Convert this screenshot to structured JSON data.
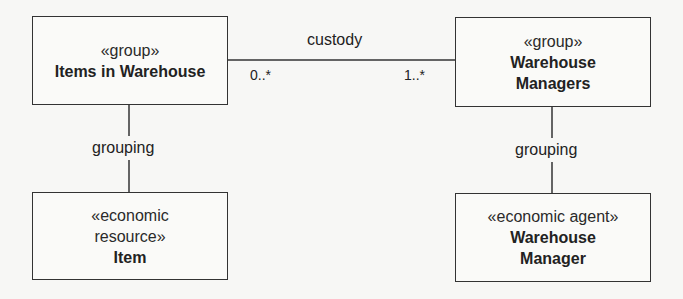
{
  "diagram": {
    "type": "uml-class-diagram",
    "boxes": [
      {
        "id": "items-in-warehouse",
        "stereotype": "«group»",
        "name_lines": [
          "Items in Warehouse"
        ]
      },
      {
        "id": "warehouse-managers",
        "stereotype": "«group»",
        "name_lines": [
          "Warehouse",
          "Managers"
        ]
      },
      {
        "id": "item",
        "stereotype_lines": [
          "«economic",
          "resource»"
        ],
        "name_lines": [
          "Item"
        ]
      },
      {
        "id": "warehouse-manager",
        "stereotype": "«economic agent»",
        "name_lines": [
          "Warehouse",
          "Manager"
        ]
      }
    ],
    "associations": [
      {
        "name": "custody",
        "from": "items-in-warehouse",
        "to": "warehouse-managers",
        "from_multiplicity": "0..*",
        "to_multiplicity": "1..*"
      },
      {
        "name": "grouping",
        "from": "items-in-warehouse",
        "to": "item"
      },
      {
        "name": "grouping",
        "from": "warehouse-managers",
        "to": "warehouse-manager"
      }
    ],
    "colors": {
      "line": "#333333",
      "text": "#222222",
      "background": "#f7f7f5"
    }
  }
}
